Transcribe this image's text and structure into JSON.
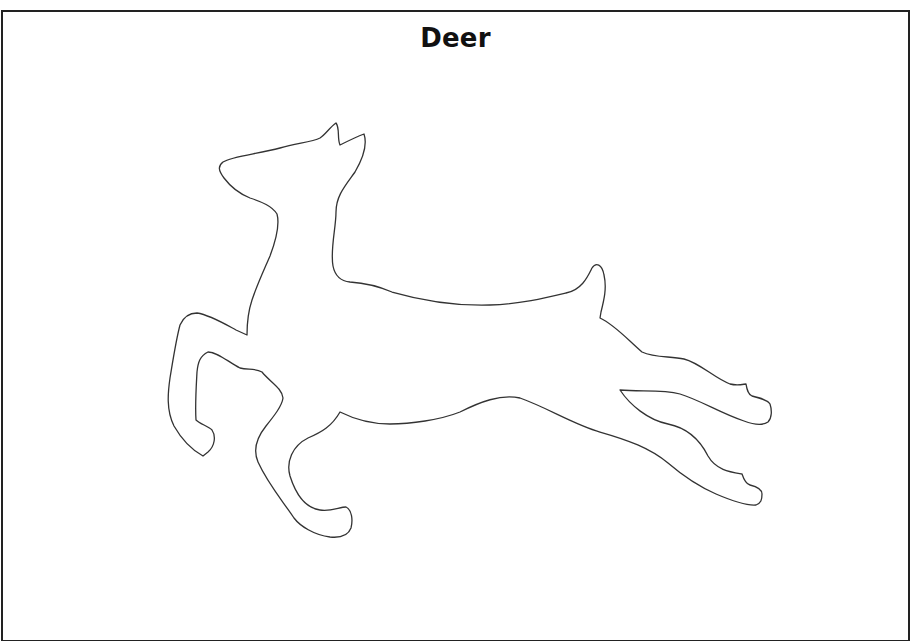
{
  "page": {
    "title": "Deer",
    "figure": {
      "subject": "deer-outline",
      "description": "Leaping deer silhouette outline (coloring/template sheet)",
      "stroke_color": "#333333",
      "fill_color": "#ffffff"
    },
    "border_color": "#222222",
    "background_color": "#ffffff"
  }
}
